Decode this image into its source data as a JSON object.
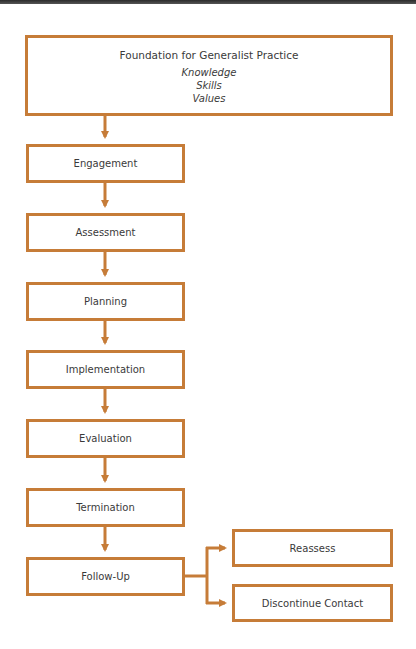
{
  "diagram": {
    "type": "flowchart",
    "accent_color": "#c67c38",
    "foundation": {
      "title": "Foundation for Generalist Practice",
      "items": [
        "Knowledge",
        "Skills",
        "Values"
      ]
    },
    "steps": [
      {
        "label": "Engagement"
      },
      {
        "label": "Assessment"
      },
      {
        "label": "Planning"
      },
      {
        "label": "Implementation"
      },
      {
        "label": "Evaluation"
      },
      {
        "label": "Termination"
      },
      {
        "label": "Follow-Up"
      }
    ],
    "branches": [
      {
        "label": "Reassess"
      },
      {
        "label": "Discontinue Contact"
      }
    ],
    "edges": [
      [
        "Foundation for Generalist Practice",
        "Engagement"
      ],
      [
        "Engagement",
        "Assessment"
      ],
      [
        "Assessment",
        "Planning"
      ],
      [
        "Planning",
        "Implementation"
      ],
      [
        "Implementation",
        "Evaluation"
      ],
      [
        "Evaluation",
        "Termination"
      ],
      [
        "Termination",
        "Follow-Up"
      ],
      [
        "Follow-Up",
        "Reassess"
      ],
      [
        "Follow-Up",
        "Discontinue Contact"
      ]
    ]
  }
}
